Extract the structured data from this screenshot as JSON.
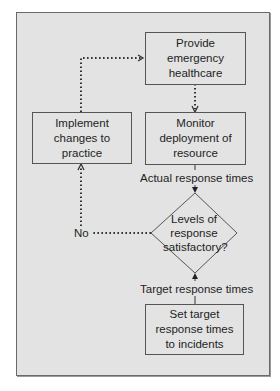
{
  "diagram": {
    "type": "flowchart",
    "colors": {
      "frame_background": "#e3e3e3",
      "frame_border": "#6a6a6a",
      "node_border": "#555555",
      "text": "#1e1e1e",
      "connector": "#333333"
    },
    "nodes": {
      "provide": {
        "label": "Provide emergency healthcare",
        "shape": "rectangle"
      },
      "monitor": {
        "label": "Monitor deployment of resource",
        "shape": "rectangle"
      },
      "implement": {
        "label": "Implement changes to practice",
        "shape": "rectangle"
      },
      "decision": {
        "label": "Levels of response satisfactory?",
        "shape": "diamond"
      },
      "set_target": {
        "label": "Set target response times to incidents",
        "shape": "rectangle"
      }
    },
    "edge_labels": {
      "actual": "Actual response times",
      "target": "Target response times",
      "no": "No"
    },
    "edges": [
      {
        "from": "provide",
        "to": "monitor",
        "style": "dotted"
      },
      {
        "from": "monitor",
        "to": "decision",
        "style": "solid",
        "label": "Actual response times"
      },
      {
        "from": "set_target",
        "to": "decision",
        "style": "solid",
        "label": "Target response times"
      },
      {
        "from": "decision",
        "to": "implement",
        "style": "dotted",
        "label": "No"
      },
      {
        "from": "implement",
        "to": "provide",
        "style": "dotted"
      }
    ]
  }
}
